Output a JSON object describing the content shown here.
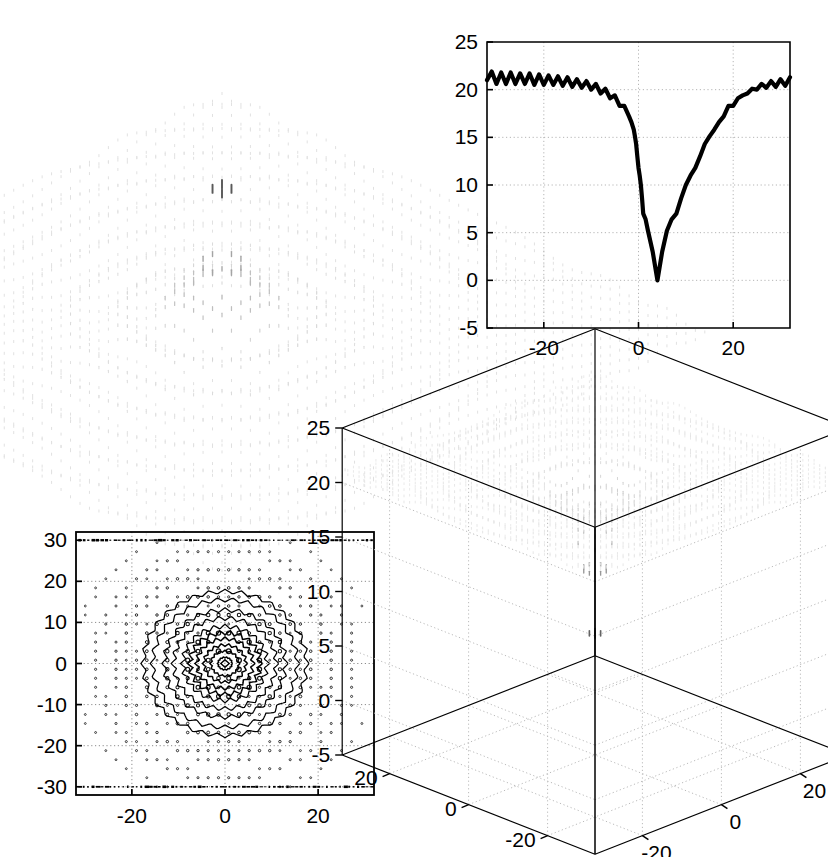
{
  "figure": {
    "title": "",
    "background_color": "#ffffff",
    "line_color": "#000000",
    "panel_count": 4
  },
  "panels": {
    "mesh_peak": {
      "name": "3D mesh surface with central peak",
      "axes_visible": false
    },
    "cross_section": {
      "name": "1D cross-section line plot"
    },
    "contour": {
      "name": "2D contour plot"
    },
    "mesh_funnel": {
      "name": "3D mesh surface inverted funnel"
    }
  },
  "chart_data": [
    {
      "id": "mesh-peak",
      "type": "surface",
      "title": "",
      "xlabel": "",
      "ylabel": "",
      "zlabel": "",
      "axes_shown": false,
      "description": "Dotted mesh surface over a square domain with a single very sharp central peak rising from a rippled, near-flat plateau; grayscale shading, dark at the apex, light at the base.",
      "xlim": [
        -32,
        32
      ],
      "ylim": [
        -32,
        32
      ],
      "zlim": [
        -5,
        25
      ],
      "peak": {
        "x": 0,
        "y": 0,
        "z": 25
      },
      "plateau_level": 21,
      "ripple_amplitude": 1.0
    },
    {
      "id": "cross-section",
      "type": "line",
      "title": "",
      "xlabel": "",
      "ylabel": "",
      "xlim": [
        -32,
        32
      ],
      "ylim": [
        -5,
        25
      ],
      "xticks": [
        -20,
        0,
        20
      ],
      "yticks": [
        -5,
        0,
        5,
        10,
        15,
        20,
        25
      ],
      "grid": true,
      "legend": null,
      "series": [
        {
          "name": "cross-section",
          "x": [
            -32,
            -31,
            -30,
            -29,
            -28,
            -27,
            -26,
            -25,
            -24,
            -23,
            -22,
            -21,
            -20,
            -19,
            -18,
            -17,
            -16,
            -15,
            -14,
            -13,
            -12,
            -11,
            -10,
            -9,
            -8,
            -7,
            -6,
            -5,
            -4,
            -3,
            -2,
            -1.5,
            -1,
            -0.75,
            -0.5,
            -0.25,
            0,
            0.25,
            0.5,
            0.75,
            1,
            1.5,
            2,
            3,
            4,
            5,
            6,
            7,
            8,
            9,
            10,
            11,
            12,
            13,
            14,
            15,
            16,
            17,
            18,
            19,
            20,
            21,
            22,
            23,
            24,
            25,
            26,
            27,
            28,
            29,
            30,
            31,
            32
          ],
          "values": [
            21.0,
            21.9,
            20.6,
            21.8,
            20.6,
            21.8,
            20.6,
            21.7,
            20.6,
            21.7,
            20.5,
            21.6,
            20.5,
            21.5,
            20.5,
            21.4,
            20.4,
            21.3,
            20.3,
            21.1,
            20.2,
            20.9,
            20.0,
            20.6,
            19.6,
            20.1,
            19.1,
            19.4,
            18.3,
            18.3,
            17.2,
            16.6,
            15.8,
            15.1,
            14.3,
            13.0,
            11.8,
            11.0,
            10.0,
            8.6,
            7.0,
            6.4,
            5.2,
            3.0,
            0.0,
            3.0,
            5.2,
            6.4,
            7.0,
            8.6,
            10.0,
            11.0,
            11.8,
            13.0,
            14.3,
            15.1,
            15.8,
            16.6,
            17.2,
            18.3,
            18.3,
            19.1,
            19.4,
            19.6,
            20.1,
            20.0,
            20.6,
            20.2,
            20.9,
            20.3,
            21.1,
            20.4,
            21.3,
            20.5,
            21.4,
            20.5,
            21.5,
            20.5,
            21.6,
            20.6,
            21.7,
            20.6,
            21.7,
            20.6,
            21.8,
            20.6,
            21.8,
            21.0
          ]
        }
      ],
      "minimum": {
        "x": 0,
        "y": 0
      },
      "plateau_level": 21,
      "description": "Deep narrow V-shaped notch reaching 0 at x = 0, rising to an oscillating plateau near 21 on both sides."
    },
    {
      "id": "contour",
      "type": "contour",
      "title": "",
      "xlabel": "",
      "ylabel": "",
      "xlim": [
        -32,
        32
      ],
      "ylim": [
        -32,
        32
      ],
      "xticks": [
        -20,
        0,
        20
      ],
      "yticks": [
        -30,
        -20,
        -10,
        0,
        10,
        20,
        30
      ],
      "grid": true,
      "center": {
        "x": 0,
        "y": 0
      },
      "ring_radii": [
        1.5,
        3,
        4.5,
        6,
        7.5,
        9,
        11,
        13,
        15.5,
        17.5
      ],
      "description": "Concentric closed contour rings about the origin with jagged sawtooth-shaped edges, surrounded by scattered speckled dot contours forming a square lattice pattern."
    },
    {
      "id": "mesh-funnel",
      "type": "surface",
      "title": "",
      "xlabel": "",
      "ylabel": "",
      "zlabel": "",
      "xlim": [
        -32,
        32
      ],
      "ylim": [
        -32,
        32
      ],
      "zlim": [
        -5,
        25
      ],
      "xticks": [
        -20,
        0,
        20
      ],
      "yticks": [
        -20,
        0,
        20
      ],
      "zticks": [
        -5,
        0,
        5,
        10,
        15,
        20,
        25
      ],
      "grid": true,
      "box": true,
      "minimum": {
        "x": 0,
        "y": 0,
        "z": -2
      },
      "plateau_level": 20,
      "description": "Dotted mesh surface seen from below: a flat speckled plateau near z = 20 with a deep conical funnel plunging to a sharp tip near z = -2 at the origin; shading darkens toward the tip."
    }
  ],
  "axis_labels": {
    "cross_section_x": [
      "-20",
      "0",
      "20"
    ],
    "cross_section_y": [
      "25",
      "20",
      "15",
      "10",
      "5",
      "0",
      "-5"
    ],
    "contour_x": [
      "-20",
      "0",
      "20"
    ],
    "contour_y": [
      "30",
      "20",
      "10",
      "0",
      "-10",
      "-20",
      "-30"
    ],
    "funnel_z": [
      "25",
      "20",
      "15",
      "10",
      "5",
      "0",
      "-5"
    ],
    "funnel_x_left": [
      "20",
      "0",
      "-20"
    ],
    "funnel_y_right": [
      "-20",
      "0",
      "20"
    ]
  }
}
